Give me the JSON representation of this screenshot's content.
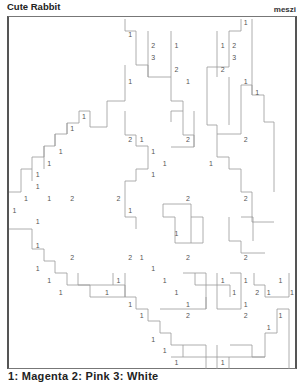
{
  "header": {
    "title": "Cute Rabbit",
    "author": "meszi"
  },
  "puzzle": {
    "type": "link-a-pix",
    "columns": 25,
    "rows": 30,
    "clues": [
      {
        "r": 0,
        "c": 20,
        "v": "1"
      },
      {
        "r": 1,
        "c": 10,
        "v": "1"
      },
      {
        "r": 2,
        "c": 12,
        "v": "2"
      },
      {
        "r": 2,
        "c": 14,
        "v": "1"
      },
      {
        "r": 2,
        "c": 18,
        "v": "1"
      },
      {
        "r": 2,
        "c": 19,
        "v": "2"
      },
      {
        "r": 3,
        "c": 12,
        "v": "3"
      },
      {
        "r": 3,
        "c": 19,
        "v": "3"
      },
      {
        "r": 4,
        "c": 14,
        "v": "2"
      },
      {
        "r": 4,
        "c": 18,
        "v": "2"
      },
      {
        "r": 5,
        "c": 10,
        "v": "1"
      },
      {
        "r": 5,
        "c": 15,
        "v": "1"
      },
      {
        "r": 5,
        "c": 20,
        "v": "1"
      },
      {
        "r": 6,
        "c": 21,
        "v": "1"
      },
      {
        "r": 8,
        "c": 6,
        "v": "1"
      },
      {
        "r": 9,
        "c": 5,
        "v": "1"
      },
      {
        "r": 10,
        "c": 10,
        "v": "2"
      },
      {
        "r": 10,
        "c": 11,
        "v": "1"
      },
      {
        "r": 10,
        "c": 15,
        "v": "2"
      },
      {
        "r": 10,
        "c": 20,
        "v": "2"
      },
      {
        "r": 11,
        "c": 4,
        "v": "1"
      },
      {
        "r": 11,
        "c": 12,
        "v": "1"
      },
      {
        "r": 12,
        "c": 3,
        "v": "1"
      },
      {
        "r": 12,
        "c": 13,
        "v": "1"
      },
      {
        "r": 12,
        "c": 17,
        "v": "1"
      },
      {
        "r": 13,
        "c": 2,
        "v": "1"
      },
      {
        "r": 13,
        "c": 12,
        "v": "1"
      },
      {
        "r": 14,
        "c": 2,
        "v": "1"
      },
      {
        "r": 15,
        "c": 1,
        "v": "1"
      },
      {
        "r": 15,
        "c": 3,
        "v": "1"
      },
      {
        "r": 15,
        "c": 5,
        "v": "2"
      },
      {
        "r": 15,
        "c": 9,
        "v": "2"
      },
      {
        "r": 15,
        "c": 15,
        "v": "2"
      },
      {
        "r": 15,
        "c": 20,
        "v": "2"
      },
      {
        "r": 16,
        "c": 0,
        "v": "1"
      },
      {
        "r": 16,
        "c": 10,
        "v": "1"
      },
      {
        "r": 17,
        "c": 2,
        "v": "1"
      },
      {
        "r": 18,
        "c": 14,
        "v": "1"
      },
      {
        "r": 19,
        "c": 2,
        "v": "1"
      },
      {
        "r": 20,
        "c": 5,
        "v": "2"
      },
      {
        "r": 20,
        "c": 10,
        "v": "2"
      },
      {
        "r": 20,
        "c": 11,
        "v": "1"
      },
      {
        "r": 20,
        "c": 15,
        "v": "2"
      },
      {
        "r": 20,
        "c": 20,
        "v": "2"
      },
      {
        "r": 21,
        "c": 2,
        "v": "1"
      },
      {
        "r": 21,
        "c": 12,
        "v": "1"
      },
      {
        "r": 22,
        "c": 3,
        "v": "1"
      },
      {
        "r": 22,
        "c": 9,
        "v": "1"
      },
      {
        "r": 22,
        "c": 13,
        "v": "1"
      },
      {
        "r": 22,
        "c": 18,
        "v": "1"
      },
      {
        "r": 22,
        "c": 20,
        "v": "1"
      },
      {
        "r": 22,
        "c": 23,
        "v": "1"
      },
      {
        "r": 23,
        "c": 4,
        "v": "1"
      },
      {
        "r": 23,
        "c": 8,
        "v": "1"
      },
      {
        "r": 23,
        "c": 14,
        "v": "1"
      },
      {
        "r": 23,
        "c": 19,
        "v": "1"
      },
      {
        "r": 23,
        "c": 21,
        "v": "2"
      },
      {
        "r": 23,
        "c": 22,
        "v": "1"
      },
      {
        "r": 23,
        "c": 24,
        "v": "1"
      },
      {
        "r": 24,
        "c": 10,
        "v": "1"
      },
      {
        "r": 24,
        "c": 15,
        "v": "1"
      },
      {
        "r": 24,
        "c": 20,
        "v": "1"
      },
      {
        "r": 25,
        "c": 11,
        "v": "1"
      },
      {
        "r": 25,
        "c": 15,
        "v": "2"
      },
      {
        "r": 25,
        "c": 20,
        "v": "2"
      },
      {
        "r": 25,
        "c": 23,
        "v": "1"
      },
      {
        "r": 26,
        "c": 22,
        "v": "1"
      },
      {
        "r": 27,
        "c": 12,
        "v": "1"
      },
      {
        "r": 28,
        "c": 13,
        "v": "1"
      },
      {
        "r": 29,
        "c": 14,
        "v": "1"
      },
      {
        "r": 29,
        "c": 18,
        "v": "1"
      }
    ]
  },
  "legend": {
    "text": "1: Magenta   2: Pink   3: White"
  }
}
